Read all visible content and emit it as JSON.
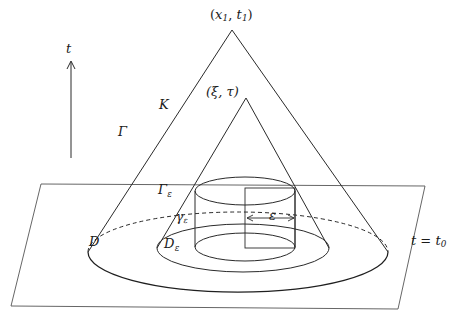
{
  "figure": {
    "width": 460,
    "height": 320,
    "background": "#ffffff",
    "stroke_color": "#2a2a2a",
    "text_color": "#1a1a1a"
  },
  "labels": {
    "apex_outer": "(x₁, t₁)",
    "apex_outer_base": "x",
    "apex_outer_sub": "1",
    "apex_outer_base2": "t",
    "apex_outer_sub2": "1",
    "apex_inner": "(ξ, τ)",
    "cone_interior": "K",
    "cone_lateral": "Γ",
    "time_axis": "t",
    "cylinder_lateral": "Γ",
    "cylinder_lateral_sub": "ε",
    "cylinder_circle": "γ",
    "cylinder_circle_sub": "ε",
    "disk": "D",
    "disk_eps": "D",
    "disk_eps_sub": "ε",
    "epsilon_measure": "ε",
    "time_plane": "t = t₀",
    "time_plane_lhs": "t",
    "time_plane_rhs_base": "t",
    "time_plane_rhs_sub": "0"
  },
  "geometry": {
    "plane": {
      "name": "t = t0 plane",
      "points": "41,184 425,186 398,309 11,306"
    },
    "outer_cone": {
      "apex": [
        232,
        30
      ],
      "base_center": [
        238,
        252
      ],
      "base_rx": 150,
      "base_ry": 40,
      "left_edge": "232,30 88,252",
      "right_edge": "232,30 388,252"
    },
    "inner_cone": {
      "apex": [
        246,
        98
      ],
      "base_center": [
        243,
        248
      ],
      "base_rx": 86,
      "base_ry": 24,
      "left_edge": "246,98 157,248",
      "right_edge": "246,98 329,248"
    },
    "cylinder": {
      "center_x": 245,
      "top_y": 191,
      "bottom_y": 247,
      "rx": 50,
      "ry": 14
    },
    "rectangle": {
      "x": 245,
      "y": 188,
      "width": 50,
      "height": 60
    },
    "epsilon_arrow": {
      "y": 218,
      "x_start": 246,
      "x_end": 296
    },
    "time_axis_arrow": {
      "x": 71,
      "y_top": 62,
      "y_bottom": 158
    }
  }
}
